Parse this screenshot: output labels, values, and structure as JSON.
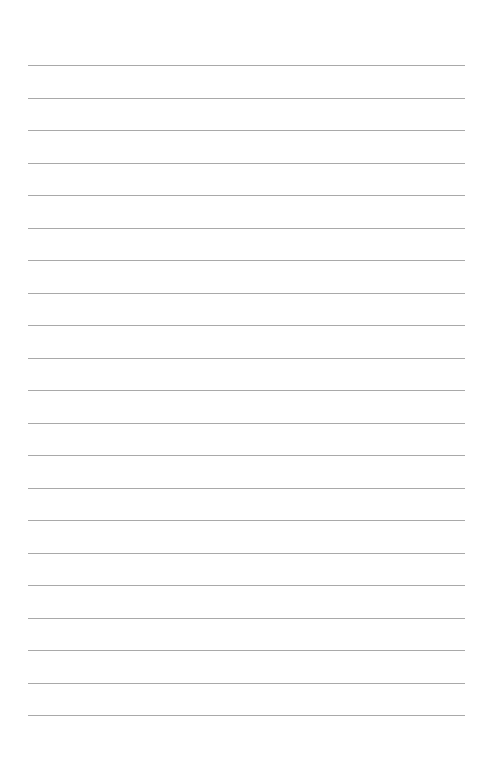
{
  "page": {
    "type": "lined-paper",
    "background_color": "#ffffff",
    "line_color": "#a9a9a9",
    "line_count": 21,
    "first_line_y": 65,
    "line_spacing": 32.5,
    "line_left": 28,
    "line_right": 465
  }
}
